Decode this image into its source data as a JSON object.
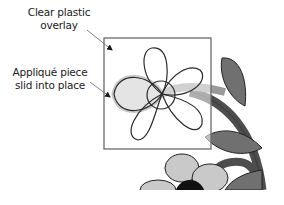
{
  "diagram": {
    "labels": {
      "overlay_line1": "Clear plastic",
      "overlay_line2": "overlay",
      "applique_line1": "Appliqué piece",
      "applique_line2": "slid into place"
    },
    "colors": {
      "outline": "#2a2a2a",
      "overlay_border": "#6a6a6a",
      "applique_fill": "#e4e4e4",
      "applique_halo": "#c8c8c8",
      "stem_light": "#9a9a9a",
      "stem_dark": "#4d4d4d",
      "leaf": "#707070",
      "petal_light": "#c9c9c9",
      "center_dark": "#111111"
    }
  }
}
